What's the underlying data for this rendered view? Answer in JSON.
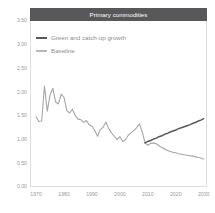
{
  "chart_data": {
    "type": "line",
    "title": "Primary commodities",
    "xlabel": "",
    "ylabel": "",
    "xlim": [
      1968,
      2031
    ],
    "ylim": [
      0.0,
      3.5
    ],
    "grid": false,
    "legend_position": "top-left",
    "x_ticks": [
      "1970",
      "1980",
      "1990",
      "2000",
      "2010",
      "2020",
      "2030"
    ],
    "x_tick_values": [
      1970,
      1980,
      1990,
      2000,
      2010,
      2020,
      2030
    ],
    "y_ticks": [
      "0.00",
      "0.50",
      "1.00",
      "1.50",
      "2.00",
      "2.50",
      "3.00",
      "3.50"
    ],
    "y_tick_values": [
      0.0,
      0.5,
      1.0,
      1.5,
      2.0,
      2.5,
      3.0,
      3.5
    ],
    "series": [
      {
        "name": "Green and catch-up growth",
        "color": "#58585a",
        "x": [
          2009,
          2010,
          2011,
          2012,
          2013,
          2014,
          2015,
          2016,
          2017,
          2018,
          2019,
          2020,
          2021,
          2022,
          2023,
          2024,
          2025,
          2026,
          2027,
          2028,
          2029,
          2030
        ],
        "values": [
          0.92,
          0.95,
          0.97,
          1.0,
          1.02,
          1.05,
          1.07,
          1.1,
          1.12,
          1.15,
          1.17,
          1.19,
          1.22,
          1.24,
          1.26,
          1.28,
          1.3,
          1.33,
          1.35,
          1.38,
          1.4,
          1.43
        ]
      },
      {
        "name": "Baseline",
        "color": "#a6a6a6",
        "x": [
          1970,
          1971,
          1972,
          1973,
          1974,
          1975,
          1976,
          1977,
          1978,
          1979,
          1980,
          1981,
          1982,
          1983,
          1984,
          1985,
          1986,
          1987,
          1988,
          1989,
          1990,
          1991,
          1992,
          1993,
          1994,
          1995,
          1996,
          1997,
          1998,
          1999,
          2000,
          2001,
          2002,
          2003,
          2004,
          2005,
          2006,
          2007,
          2008,
          2009,
          2010,
          2011,
          2012,
          2013,
          2014,
          2015,
          2016,
          2017,
          2018,
          2019,
          2020,
          2021,
          2022,
          2023,
          2024,
          2025,
          2026,
          2027,
          2028,
          2029,
          2030
        ],
        "values": [
          1.47,
          1.37,
          1.38,
          2.12,
          1.59,
          1.93,
          2.07,
          1.78,
          1.74,
          1.95,
          1.88,
          1.6,
          1.55,
          1.63,
          1.5,
          1.42,
          1.41,
          1.35,
          1.39,
          1.3,
          1.27,
          1.18,
          1.06,
          1.2,
          1.25,
          1.36,
          1.22,
          1.13,
          1.06,
          0.99,
          1.05,
          0.95,
          0.99,
          1.08,
          1.13,
          1.18,
          1.24,
          1.32,
          1.15,
          0.92,
          0.87,
          0.91,
          0.92,
          0.9,
          0.86,
          0.82,
          0.79,
          0.76,
          0.74,
          0.72,
          0.71,
          0.69,
          0.68,
          0.67,
          0.66,
          0.65,
          0.64,
          0.63,
          0.61,
          0.6,
          0.58
        ]
      }
    ]
  },
  "colors": {
    "title_bar": "#58585a",
    "title_text": "#ffffff",
    "frame": "#c8c8c8",
    "tick_text": "#9a9a9a",
    "legend_text": "#8d8d8d",
    "background": "#ffffff"
  }
}
